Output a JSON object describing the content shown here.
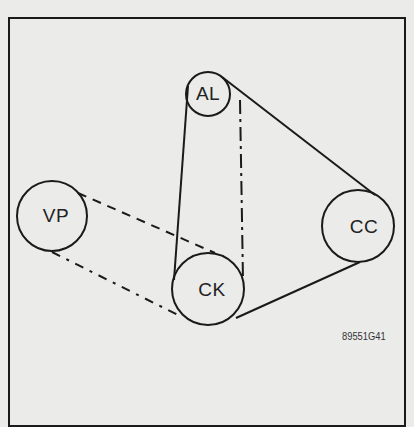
{
  "diagram": {
    "pulleys": [
      {
        "id": "AL",
        "label": "AL",
        "cx": 208,
        "cy": 94,
        "r": 22
      },
      {
        "id": "VP",
        "label": "VP",
        "cx": 52,
        "cy": 216,
        "r": 35
      },
      {
        "id": "CC",
        "label": "CC",
        "cx": 358,
        "cy": 226,
        "r": 36
      },
      {
        "id": "CK",
        "label": "CK",
        "cx": 208,
        "cy": 289,
        "r": 36
      }
    ],
    "belts": [
      {
        "name": "solid-belt",
        "style": "solid",
        "path": "AL-CC-CK"
      },
      {
        "name": "dashed-belt",
        "style": "dashed",
        "path": "VP-CK"
      },
      {
        "name": "dash-dot-belt",
        "style": "dash-dot",
        "path": "AL-CK"
      }
    ],
    "figure_id": "89551G41",
    "colors": {
      "line": "#1a1a1a",
      "background": "#ebebea"
    }
  }
}
